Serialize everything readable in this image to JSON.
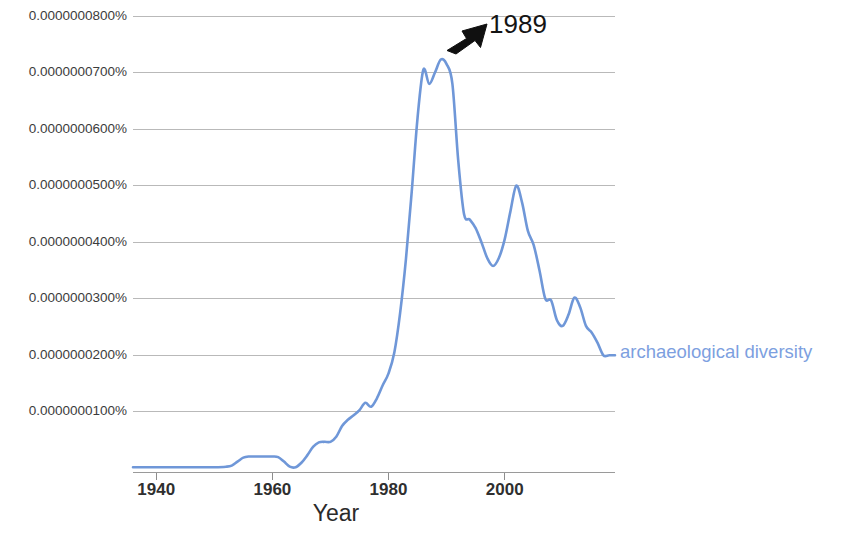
{
  "chart_data": {
    "type": "line",
    "title": "",
    "xlabel": "Year",
    "ylabel": "",
    "xlim": [
      1936,
      2019
    ],
    "ylim": [
      0,
      8.45e-08
    ],
    "grid": true,
    "legend_position": "right-of-line-end",
    "x_ticks": [
      1940,
      1960,
      1980,
      2000
    ],
    "x_tick_labels": [
      "1940",
      "1960",
      "1980",
      "2000"
    ],
    "y_ticks": [
      1e-08,
      2e-08,
      3e-08,
      4e-08,
      5e-08,
      6e-08,
      7e-08,
      8e-08
    ],
    "y_tick_labels": [
      "0.0000000100%",
      "0.0000000200%",
      "0.0000000300%",
      "0.0000000400%",
      "0.0000000500%",
      "0.0000000600%",
      "0.0000000700%",
      "0.0000000800%"
    ],
    "series": [
      {
        "name": "archaeological diversity",
        "color": "#6f97d8",
        "x": [
          1936,
          1938,
          1940,
          1942,
          1944,
          1946,
          1948,
          1950,
          1952,
          1953,
          1954,
          1955,
          1956,
          1957,
          1958,
          1959,
          1960,
          1961,
          1962,
          1963,
          1964,
          1965,
          1966,
          1967,
          1968,
          1969,
          1970,
          1971,
          1972,
          1973,
          1974,
          1975,
          1976,
          1977,
          1978,
          1979,
          1980,
          1981,
          1982,
          1983,
          1984,
          1985,
          1986,
          1987,
          1988,
          1989,
          1990,
          1991,
          1992,
          1993,
          1994,
          1995,
          1996,
          1997,
          1998,
          1999,
          2000,
          2001,
          2002,
          2003,
          2004,
          2005,
          2006,
          2007,
          2008,
          2009,
          2010,
          2011,
          2012,
          2013,
          2014,
          2015,
          2016,
          2017,
          2018,
          2019
        ],
        "y": [
          2e-10,
          2e-10,
          2e-10,
          2e-10,
          2e-10,
          2e-10,
          2e-10,
          2e-10,
          3e-10,
          5e-10,
          1.2e-09,
          1.9e-09,
          2.1e-09,
          2.1e-09,
          2.1e-09,
          2.1e-09,
          2.1e-09,
          2e-09,
          1.2e-09,
          3e-10,
          2e-10,
          1e-09,
          2.3e-09,
          3.8e-09,
          4.6e-09,
          4.7e-09,
          4.7e-09,
          5.6e-09,
          7.5e-09,
          8.6e-09,
          9.4e-09,
          1.03e-08,
          1.16e-08,
          1.09e-08,
          1.24e-08,
          1.47e-08,
          1.68e-08,
          2.05e-08,
          2.75e-08,
          3.7e-08,
          4.9e-08,
          6.2e-08,
          7.05e-08,
          6.8e-08,
          7e-08,
          7.23e-08,
          7.15e-08,
          6.8e-08,
          5.45e-08,
          4.5e-08,
          4.4e-08,
          4.25e-08,
          4e-08,
          3.72e-08,
          3.58e-08,
          3.72e-08,
          4.05e-08,
          4.55e-08,
          5e-08,
          4.7e-08,
          4.2e-08,
          3.95e-08,
          3.5e-08,
          3e-08,
          2.97e-08,
          2.62e-08,
          2.52e-08,
          2.72e-08,
          3.02e-08,
          2.85e-08,
          2.52e-08,
          2.4e-08,
          2.22e-08,
          2e-08,
          2e-08,
          2e-08
        ]
      }
    ],
    "annotations": [
      {
        "text": "1989",
        "points_to_year": 1989,
        "points_to_value": 7.23e-08,
        "arrow": true,
        "color": "#141414"
      }
    ]
  },
  "series_label": {
    "text": "archaeological diversity"
  },
  "axis": {
    "x_title": "Year"
  }
}
